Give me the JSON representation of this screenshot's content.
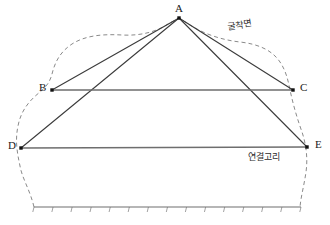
{
  "figure": {
    "title": "",
    "vertices": [
      {
        "id": "A",
        "label": "A",
        "x": 179,
        "y": 18,
        "label_x": 175,
        "label_y": 3
      },
      {
        "id": "B",
        "label": "B",
        "x": 52,
        "y": 90,
        "label_x": 39,
        "label_y": 82
      },
      {
        "id": "C",
        "label": "C",
        "x": 293,
        "y": 90,
        "label_x": 300,
        "label_y": 82
      },
      {
        "id": "D",
        "label": "D",
        "x": 21,
        "y": 148,
        "label_x": 8,
        "label_y": 140
      },
      {
        "id": "E",
        "label": "E",
        "x": 307,
        "y": 147,
        "label_x": 315,
        "label_y": 139
      }
    ],
    "edges": [
      {
        "from": "A",
        "to": "B",
        "style": "solid",
        "color": "#3b3b3b",
        "width": 1.1
      },
      {
        "from": "A",
        "to": "C",
        "style": "solid",
        "color": "#3b3b3b",
        "width": 1.1
      },
      {
        "from": "A",
        "to": "D",
        "style": "solid",
        "color": "#3b3b3b",
        "width": 1.1
      },
      {
        "from": "A",
        "to": "E",
        "style": "solid",
        "color": "#3b3b3b",
        "width": 1.1
      },
      {
        "from": "B",
        "to": "C",
        "style": "solid",
        "color": "#6e6e6e",
        "width": 1.3
      },
      {
        "from": "D",
        "to": "E",
        "style": "solid",
        "color": "#6e6e6e",
        "width": 1.3
      }
    ],
    "annotations": [
      {
        "id": "excavation-face",
        "text": "굴착면",
        "x": 228,
        "y": 22,
        "slanted": true
      },
      {
        "id": "link-ring",
        "text": "연결고리",
        "x": 248,
        "y": 152,
        "slanted": false
      }
    ],
    "boundary": {
      "name": "ground-outline",
      "style": "dashed",
      "color": "#8a8a8a",
      "width": 1.0,
      "dash": "4,3",
      "path": "M 34 207 C 30 190 22 178 20 166 C 17 152 15 140 18 126 C 21 110 30 100 40 92 C 46 87 50 82 52 74 C 55 62 60 52 72 44 C 86 35 104 34 122 35 C 140 36 156 32 168 24 L 179 18 L 190 25 C 204 34 222 40 240 42 C 258 44 272 50 280 62 C 286 71 288 80 290 90 C 293 104 297 118 302 132 C 306 144 308 158 306 172 C 304 186 301 196 300 207"
    },
    "ground_line": {
      "name": "hatched-ground-line",
      "color": "#6e6e6e",
      "width": 1.2,
      "x_start": 34,
      "x_end": 301,
      "y": 207,
      "tick_count": 14,
      "tick_length": 5,
      "tick_color": "#8a8a8a"
    },
    "node_marker": {
      "shape": "square",
      "size": 3.4,
      "color": "#111111"
    },
    "colors": {
      "background": "#ffffff",
      "edge_dark": "#3b3b3b",
      "edge_gray": "#6e6e6e",
      "boundary": "#8a8a8a",
      "text": "#1a1a1a"
    }
  }
}
